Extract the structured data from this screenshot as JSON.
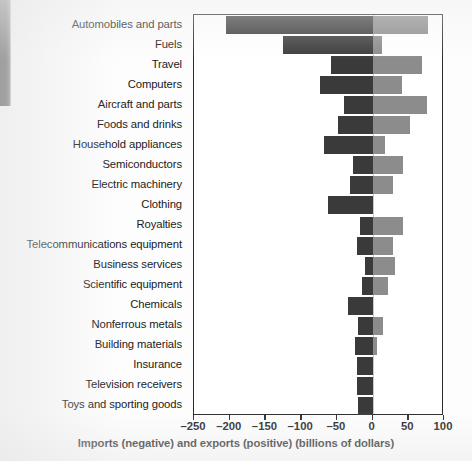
{
  "chart_data": {
    "type": "bar",
    "orientation": "horizontal",
    "title": "",
    "xlabel": "Imports (negative) and exports (positive) (billions of dollars)",
    "ylabel": "",
    "xlim": [
      -250,
      100
    ],
    "xticks": [
      -250,
      -200,
      -150,
      -100,
      -50,
      0,
      50,
      100
    ],
    "xtick_labels": [
      "–250",
      "–200",
      "–150",
      "–100",
      "–50",
      "0",
      "50",
      "100"
    ],
    "grid": false,
    "legend": null,
    "colors": {
      "imports": "#3a3a3a",
      "exports": "#8c8c8c",
      "axis": "#2b2b2b",
      "zero_line": "#c9c9c9"
    },
    "categories": [
      "Automobiles and parts",
      "Fuels",
      "Travel",
      "Computers",
      "Aircraft and parts",
      "Foods and drinks",
      "Household appliances",
      "Semiconductors",
      "Electric machinery",
      "Clothing",
      "Royalties",
      "Telecommunications equipment",
      "Business services",
      "Scientific equipment",
      "Chemicals",
      "Nonferrous metals",
      "Building materials",
      "Insurance",
      "Television receivers",
      "Toys and sporting goods"
    ],
    "series": [
      {
        "name": "Imports (negative)",
        "color": "#3a3a3a",
        "values": [
          -205,
          -125,
          -58,
          -73,
          -40,
          -48,
          -68,
          -27,
          -32,
          -62,
          -18,
          -22,
          -11,
          -15,
          -34,
          -20,
          -25,
          -22,
          -22,
          -21
        ]
      },
      {
        "name": "Exports (positive)",
        "color": "#8c8c8c",
        "values": [
          78,
          13,
          69,
          41,
          76,
          52,
          17,
          43,
          28,
          0,
          42,
          28,
          31,
          21,
          0,
          14,
          6,
          0,
          0,
          0
        ]
      }
    ]
  }
}
